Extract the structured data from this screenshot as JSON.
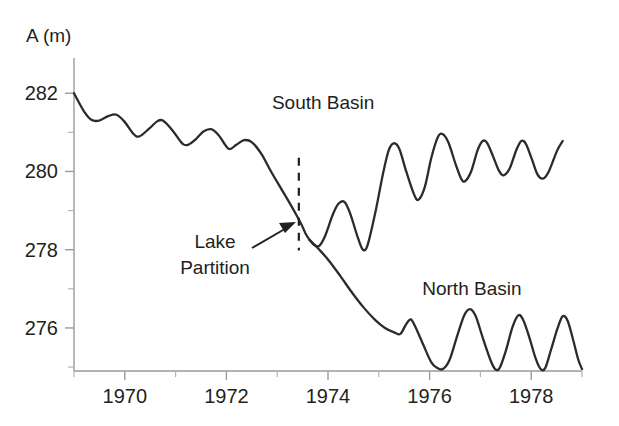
{
  "chart_data": {
    "type": "line",
    "title": "",
    "xlabel": "",
    "ylabel": "A (m)",
    "ylabel_display": "A (m)",
    "xlim": [
      1969,
      1979
    ],
    "ylim": [
      274.9,
      282.9
    ],
    "grid": false,
    "legend_position": "inline-annotations",
    "y_ticks_major": [
      276,
      278,
      280,
      282
    ],
    "y_ticks_minor": [
      275,
      277,
      279,
      281
    ],
    "y_tick_labels": [
      "276",
      "278",
      "280",
      "282"
    ],
    "x_ticks_major": [
      1970,
      1972,
      1974,
      1976,
      1978
    ],
    "x_ticks_minor": [
      1969,
      1971,
      1973,
      1975,
      1977,
      1979
    ],
    "x_tick_labels": [
      "1970",
      "1972",
      "1974",
      "1976",
      "1978"
    ],
    "annotations": [
      {
        "name": "lake-partition",
        "text_line1": "Lake",
        "text_line2": "Partition",
        "x": 1973.7,
        "arrow_to_x": 1973.65,
        "arrow_to_y": 278.6
      }
    ],
    "series": [
      {
        "name": "Combined Lake",
        "label": "",
        "label_x": null,
        "label_y": null,
        "points": [
          [
            1969.0,
            282.0
          ],
          [
            1969.25,
            281.55
          ],
          [
            1969.45,
            281.32
          ],
          [
            1969.65,
            281.3
          ],
          [
            1969.9,
            281.42
          ],
          [
            1970.1,
            281.45
          ],
          [
            1970.3,
            281.28
          ],
          [
            1970.55,
            280.95
          ],
          [
            1970.7,
            280.9
          ],
          [
            1970.95,
            281.1
          ],
          [
            1971.15,
            281.28
          ],
          [
            1971.3,
            281.3
          ],
          [
            1971.55,
            281.05
          ],
          [
            1971.8,
            280.72
          ],
          [
            1971.95,
            280.68
          ],
          [
            1972.15,
            280.82
          ],
          [
            1972.35,
            281.02
          ],
          [
            1972.55,
            281.08
          ],
          [
            1972.75,
            280.92
          ],
          [
            1973.0,
            280.58
          ],
          [
            1973.2,
            280.68
          ],
          [
            1973.4,
            280.8
          ],
          [
            1973.6,
            280.75
          ],
          [
            1973.85,
            280.45
          ],
          [
            1974.1,
            280.0
          ],
          [
            1974.35,
            279.58
          ],
          [
            1974.55,
            279.25
          ],
          [
            1974.75,
            278.9
          ],
          [
            1974.9,
            278.62
          ],
          [
            1975.0,
            278.4
          ],
          [
            1975.1,
            278.25
          ]
        ]
      },
      {
        "name": "South Basin",
        "label": "South Basin",
        "label_x": 1975.45,
        "label_y": 281.6,
        "points": [
          [
            1975.1,
            278.25
          ],
          [
            1975.22,
            278.12
          ],
          [
            1975.35,
            278.1
          ],
          [
            1975.5,
            278.35
          ],
          [
            1975.7,
            278.9
          ],
          [
            1975.85,
            279.18
          ],
          [
            1976.0,
            279.22
          ],
          [
            1976.15,
            278.92
          ],
          [
            1976.35,
            278.3
          ],
          [
            1976.48,
            278.0
          ],
          [
            1976.6,
            278.12
          ],
          [
            1976.8,
            278.95
          ],
          [
            1977.0,
            279.95
          ],
          [
            1977.15,
            280.55
          ],
          [
            1977.28,
            280.72
          ],
          [
            1977.42,
            280.58
          ],
          [
            1977.6,
            280.0
          ],
          [
            1977.8,
            279.42
          ],
          [
            1977.92,
            279.28
          ],
          [
            1978.08,
            279.6
          ],
          [
            1978.25,
            280.35
          ],
          [
            1978.42,
            280.88
          ],
          [
            1978.55,
            280.95
          ],
          [
            1978.7,
            280.72
          ],
          [
            1978.88,
            280.18
          ],
          [
            1979.02,
            279.82
          ],
          [
            1979.12,
            279.75
          ],
          [
            1979.28,
            280.0
          ],
          [
            1979.45,
            280.55
          ],
          [
            1979.58,
            280.78
          ],
          [
            1979.7,
            280.72
          ],
          [
            1979.85,
            280.38
          ],
          [
            1980.0,
            280.02
          ],
          [
            1980.12,
            279.9
          ],
          [
            1980.28,
            280.08
          ],
          [
            1980.45,
            280.55
          ],
          [
            1980.58,
            280.78
          ],
          [
            1980.7,
            280.7
          ],
          [
            1980.85,
            280.32
          ],
          [
            1981.0,
            279.92
          ],
          [
            1981.15,
            279.82
          ],
          [
            1981.3,
            280.02
          ],
          [
            1981.5,
            280.52
          ],
          [
            1981.65,
            280.78
          ]
        ]
      },
      {
        "name": "North Basin",
        "label": "North Basin",
        "label_x": 1979.3,
        "label_y": 276.85,
        "points": [
          [
            1975.1,
            278.25
          ],
          [
            1975.35,
            278.0
          ],
          [
            1975.6,
            277.72
          ],
          [
            1975.9,
            277.32
          ],
          [
            1976.2,
            276.9
          ],
          [
            1976.5,
            276.52
          ],
          [
            1976.8,
            276.2
          ],
          [
            1977.05,
            276.0
          ],
          [
            1977.3,
            275.88
          ],
          [
            1977.45,
            275.85
          ],
          [
            1977.6,
            276.1
          ],
          [
            1977.72,
            276.22
          ],
          [
            1977.85,
            276.0
          ],
          [
            1978.05,
            275.55
          ],
          [
            1978.25,
            275.12
          ],
          [
            1978.4,
            274.98
          ],
          [
            1978.55,
            274.95
          ],
          [
            1978.72,
            275.18
          ],
          [
            1978.92,
            275.8
          ],
          [
            1979.1,
            276.32
          ],
          [
            1979.25,
            276.48
          ],
          [
            1979.4,
            276.3
          ],
          [
            1979.58,
            275.75
          ],
          [
            1979.78,
            275.18
          ],
          [
            1979.9,
            274.95
          ],
          [
            1980.02,
            274.98
          ],
          [
            1980.18,
            275.42
          ],
          [
            1980.35,
            276.02
          ],
          [
            1980.5,
            276.32
          ],
          [
            1980.62,
            276.22
          ],
          [
            1980.78,
            275.78
          ],
          [
            1980.95,
            275.22
          ],
          [
            1981.08,
            274.95
          ],
          [
            1981.2,
            274.98
          ],
          [
            1981.35,
            275.45
          ],
          [
            1981.52,
            276.0
          ],
          [
            1981.65,
            276.3
          ],
          [
            1981.78,
            276.18
          ],
          [
            1981.92,
            275.7
          ],
          [
            1982.05,
            275.2
          ],
          [
            1982.15,
            274.95
          ]
        ]
      }
    ],
    "partition": {
      "name": "Lake Partition",
      "x": 1974.82,
      "y_top": 280.35,
      "y_bottom": 277.98
    }
  }
}
